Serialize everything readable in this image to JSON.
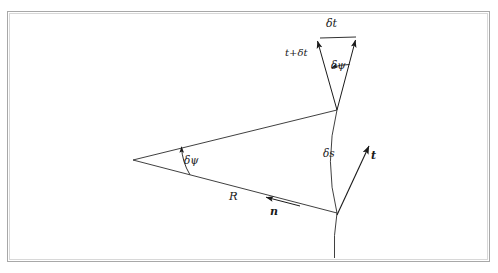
{
  "figure": {
    "background_color": "#ffffff",
    "stroke_color": "#1a1a1a",
    "frame_color_outer": "#a8a8a8",
    "frame_color_inner": "#d8d8d8"
  },
  "labels": {
    "delta_t": "δt",
    "t_plus_delta_t": "t+δt",
    "delta_psi_top": "δψ",
    "delta_psi_apex": "δψ",
    "delta_s": "δs",
    "tangent": "t",
    "normal": "n",
    "radius": "R"
  },
  "geometry": {
    "center_of_curvature": [
      133,
      160
    ],
    "arc_upper_point": [
      337,
      110
    ],
    "arc_lower_point": [
      337,
      213
    ],
    "arc_tail_point": [
      335,
      258
    ],
    "tangent_arrow_tip": [
      370,
      144
    ],
    "tangent_vector_label_pos": [
      371,
      150
    ],
    "normal_arrow_tip": [
      268,
      198
    ],
    "vector_triangle_apex": [
      337,
      110
    ],
    "vector_triangle_left_tip": [
      318,
      38
    ],
    "vector_triangle_right_tip": [
      356,
      36
    ],
    "delta_t_connector": [
      [
        318,
        38
      ],
      [
        356,
        37
      ]
    ],
    "angle_arc_apex_radius": 58,
    "angle_arc_top_radius": 48
  }
}
